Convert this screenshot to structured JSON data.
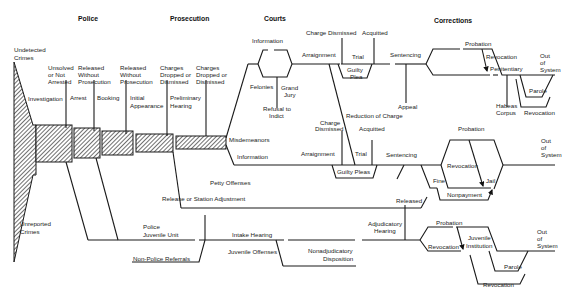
{
  "headers": {
    "police": "Police",
    "prosecution": "Prosecution",
    "courts": "Courts",
    "corrections": "Corrections"
  },
  "entry": {
    "undetected_1": "Undetected",
    "undetected_2": "Crimes",
    "unreported_1": "Unreported",
    "unreported_2": "Crimes"
  },
  "police": {
    "unsolved_1": "Unsolved",
    "unsolved_2": "or Not",
    "unsolved_3": "Arrested",
    "released_1": "Released",
    "released_2": "Without",
    "released_3": "Prosecution",
    "investigation": "Investigation",
    "arrest": "Arrest",
    "booking": "Booking"
  },
  "prosecution": {
    "released_1": "Released",
    "released_2": "Without",
    "released_3": "Prosecution",
    "dropped1_1": "Charges",
    "dropped1_2": "Dropped or",
    "dropped1_3": "Dismissed",
    "dropped2_1": "Charges",
    "dropped2_2": "Dropped or",
    "dropped2_3": "Dismissed",
    "initial_1": "Initial",
    "initial_2": "Appearance",
    "prelim_1": "Preliminary",
    "prelim_2": "Hearing"
  },
  "courts": {
    "information_top": "Information",
    "felonies": "Felonies",
    "grand_jury_1": "Grand",
    "grand_jury_2": "Jury",
    "refusal_1": "Refusal to",
    "refusal_2": "Indict",
    "charge_dismissed_top": "Charge Dismissed",
    "acquitted_top": "Acquitted",
    "arraignment_top": "Arraignment",
    "trial_top": "Trial",
    "guilty_plea_1": "Guilty",
    "guilty_plea_2": "Plea",
    "misdemeanors": "Misdemeanors",
    "information_bottom": "Information",
    "charge_dismissed_mid_1": "Charge",
    "charge_dismissed_mid_2": "Dismissed",
    "reduction": "Reduction of Charge",
    "acquitted_mid": "Acquitted",
    "arraignment_mid": "Arraignment",
    "trial_mid": "Trial",
    "guilty_pleas": "Guilty Pleas",
    "petty_offenses": "Petty Offenses"
  },
  "corrections": {
    "sentencing_top": "Sentencing",
    "appeal": "Appeal",
    "probation_top": "Probation",
    "revocation_top": "Revocation",
    "penitentiary": "Penitentiary",
    "out1_1": "Out",
    "out1_2": "of",
    "out1_3": "System",
    "parole_top": "Parole",
    "habeas_1": "Habeas",
    "habeas_2": "Corpus",
    "revocation_parole": "Revocation",
    "sentencing_mid": "Sentencing",
    "probation_mid": "Probation",
    "revocation_mid": "Revocation",
    "jail": "Jail",
    "fine": "Fine",
    "nonpayment": "Nonpayment",
    "out2_1": "Out",
    "out2_2": "of",
    "out2_3": "System"
  },
  "juvenile": {
    "release_station": "Release or Station Adjustment",
    "police_juv_1": "Police",
    "police_juv_2": "Juvenile Unit",
    "non_police": "Non-Police Referrals",
    "intake": "Intake Hearing",
    "juv_offenses": "Juvenile Offenses",
    "nonadj_1": "Nonadjudicatory",
    "nonadj_2": "Disposition",
    "released": "Released",
    "adj_1": "Adjudicatory",
    "adj_2": "Hearing",
    "probation": "Probation",
    "revocation_left": "Revocation",
    "juv_inst_1": "Juvenile",
    "juv_inst_2": "Institution",
    "parole": "Parole",
    "revocation_bottom": "Revocation",
    "out3_1": "Out",
    "out3_2": "of",
    "out3_3": "System"
  }
}
